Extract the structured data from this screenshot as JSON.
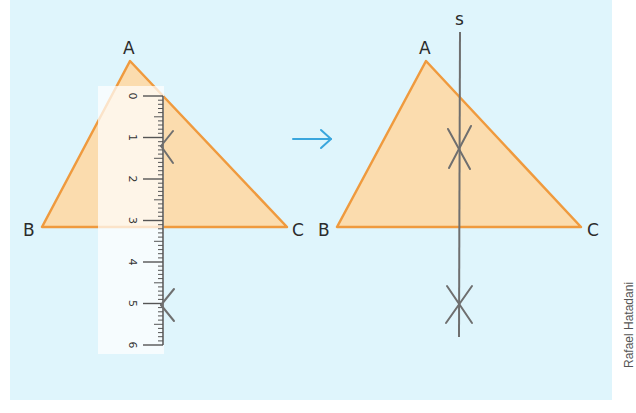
{
  "colors": {
    "background": "#dff5fc",
    "triangle_fill": "#fbdcae",
    "triangle_stroke": "#ef9a3e",
    "construction_line": "#6f6f6f",
    "arrow": "#3aa6dd",
    "ruler_bg": "#fdfbf5",
    "text": "#2b2b2b"
  },
  "left_figure": {
    "vertices": {
      "A": "A",
      "B": "B",
      "C": "C"
    },
    "ruler": {
      "ticks": [
        "0",
        "1",
        "2",
        "3",
        "4",
        "5",
        "6"
      ],
      "unit": "cm"
    }
  },
  "transition_arrow": "→",
  "right_figure": {
    "vertices": {
      "A": "A",
      "B": "B",
      "C": "C"
    },
    "line_label": "s"
  },
  "credit": "Rafael Hatadani"
}
